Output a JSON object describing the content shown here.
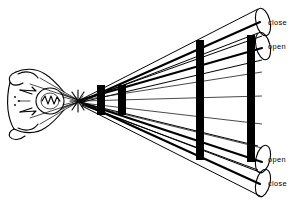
{
  "diagram": {
    "background_color": "#ffffff",
    "line_color": "#000000",
    "width": 292,
    "height": 205,
    "source": {
      "name": "light-source-sketch",
      "description": "hand-drawn emitter at left edge"
    },
    "crossing_point": {
      "x": 78,
      "y": 101,
      "label": ""
    },
    "bars": [
      {
        "name": "bar-1",
        "x": 97,
        "y": 85,
        "width": 8,
        "height": 30,
        "color": "#000000"
      },
      {
        "name": "bar-2",
        "x": 118,
        "y": 85,
        "width": 8,
        "height": 30,
        "color": "#000000"
      },
      {
        "name": "bar-3",
        "x": 196,
        "y": 40,
        "width": 8,
        "height": 120,
        "color": "#000000"
      },
      {
        "name": "bar-4",
        "x": 247,
        "y": 35,
        "width": 8,
        "height": 127,
        "color": "#000000"
      }
    ],
    "cylinders": [
      {
        "name": "cylinder-top-outer",
        "label": "close",
        "label_x": 265,
        "label_y": 23,
        "tip_x": 82,
        "tip_y": 99,
        "end_cx": 263,
        "end_cy": 22,
        "end_rx": 7,
        "end_ry": 14,
        "rotation": -14
      },
      {
        "name": "cylinder-top-inner",
        "label": "open",
        "label_x": 265,
        "label_y": 47,
        "tip_x": 82,
        "tip_y": 101,
        "end_cx": 263,
        "end_cy": 46,
        "end_rx": 7,
        "end_ry": 14,
        "rotation": -14
      },
      {
        "name": "cylinder-bottom-inner",
        "label": "open",
        "label_x": 265,
        "label_y": 160,
        "tip_x": 82,
        "tip_y": 103,
        "end_cx": 263,
        "end_cy": 159,
        "end_rx": 7,
        "end_ry": 14,
        "rotation": 14
      },
      {
        "name": "cylinder-bottom-outer",
        "label": "close",
        "label_x": 265,
        "label_y": 184,
        "tip_x": 82,
        "tip_y": 105,
        "end_cx": 263,
        "end_cy": 183,
        "end_rx": 7,
        "end_ry": 14,
        "rotation": 14
      }
    ],
    "labels": [
      {
        "name": "label-top-close",
        "text": "close",
        "x": 268,
        "y": 25
      },
      {
        "name": "label-top-open",
        "text": "open",
        "x": 268,
        "y": 49
      },
      {
        "name": "label-bottom-open",
        "text": "open",
        "x": 268,
        "y": 162
      },
      {
        "name": "label-bottom-close",
        "text": "close",
        "x": 268,
        "y": 186
      }
    ]
  }
}
